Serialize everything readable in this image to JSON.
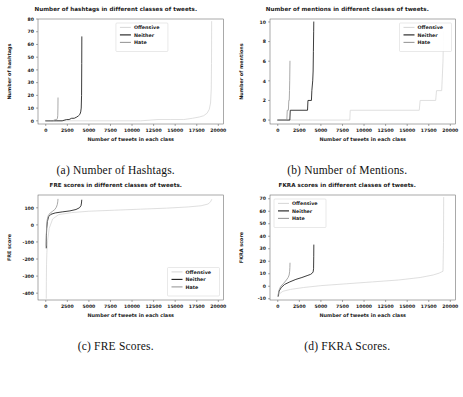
{
  "figure": {
    "layout": "2x2 grid of line charts",
    "series_colors": {
      "Offensive": "#d9d9d9",
      "Neither": "#1a1a1a",
      "Hate": "#9a9a9a"
    }
  },
  "panels": [
    {
      "id": "a",
      "caption": "(a) Number of Hashtags.",
      "legend_position": "top-center",
      "chart_data": {
        "type": "line",
        "title": "Number of hashtags in different classes of tweets.",
        "xlabel": "Number of tweets in each class",
        "ylabel": "Number of hashtags",
        "xlim": [
          -900,
          20600
        ],
        "ylim": [
          -2.5,
          80
        ],
        "xticks": [
          0,
          2500,
          5000,
          7500,
          10000,
          12500,
          15000,
          17500,
          20000
        ],
        "yticks": [
          0,
          10,
          20,
          30,
          40,
          50,
          60,
          70,
          80
        ],
        "grid": false,
        "legend": [
          "Offensive",
          "Neither",
          "Hate"
        ],
        "series": [
          {
            "name": "Offensive",
            "color": "#d9d9d9",
            "x": [
              0,
              2000,
              5000,
              8000,
              11000,
              13000,
              14500,
              16000,
              17000,
              17800,
              18300,
              18700,
              18950,
              19100,
              19180,
              19210,
              19225
            ],
            "y": [
              0,
              0,
              0,
              0,
              0,
              1,
              1,
              1,
              2,
              3,
              4,
              6,
              9,
              14,
              25,
              45,
              78
            ]
          },
          {
            "name": "Neither",
            "color": "#1a1a1a",
            "x": [
              0,
              500,
              1200,
              1900,
              2400,
              2700,
              3000,
              3300,
              3600,
              3800,
              3950,
              4050,
              4110,
              4150,
              4170,
              4180
            ],
            "y": [
              0,
              0,
              0,
              0,
              1,
              1,
              2,
              2,
              3,
              4,
              5,
              7,
              10,
              20,
              45,
              66
            ]
          },
          {
            "name": "Hate",
            "color": "#9a9a9a",
            "x": [
              0,
              400,
              800,
              1100,
              1280,
              1350,
              1390,
              1410,
              1420
            ],
            "y": [
              0,
              0,
              0,
              1,
              1,
              2,
              4,
              10,
              18
            ]
          }
        ]
      }
    },
    {
      "id": "b",
      "caption": "(b) Number of Mentions.",
      "legend_position": "top-right",
      "chart_data": {
        "type": "line",
        "title": "Number of mentions in different classes of tweets.",
        "xlabel": "Number of tweets in each class",
        "ylabel": "Number of mentions",
        "xlim": [
          -900,
          20600
        ],
        "ylim": [
          -0.4,
          10.3
        ],
        "xticks": [
          0,
          2500,
          5000,
          7500,
          10000,
          12500,
          15000,
          17500,
          20000
        ],
        "yticks": [
          0,
          2,
          4,
          6,
          8,
          10
        ],
        "grid": false,
        "legend": [
          "Offensive",
          "Neither",
          "Hate"
        ],
        "series": [
          {
            "name": "Offensive",
            "color": "#d9d9d9",
            "x": [
              0,
              4000,
              8000,
              8350,
              8400,
              16400,
              16500,
              18300,
              18400,
              19000,
              19050,
              19150,
              19200,
              19225
            ],
            "y": [
              0,
              0,
              0,
              0,
              1,
              1,
              2,
              2,
              3,
              3,
              4,
              6,
              8,
              9
            ]
          },
          {
            "name": "Neither",
            "color": "#1a1a1a",
            "x": [
              0,
              1400,
              1450,
              3450,
              3500,
              3900,
              3950,
              4050,
              4100,
              4130,
              4160,
              4175
            ],
            "y": [
              0,
              0,
              1,
              1,
              2,
              2,
              3,
              4,
              5,
              7,
              9,
              10
            ]
          },
          {
            "name": "Hate",
            "color": "#9a9a9a",
            "x": [
              0,
              1050,
              1100,
              1230,
              1280,
              1330,
              1360,
              1385,
              1400,
              1415
            ],
            "y": [
              0,
              0,
              1,
              1,
              2,
              2,
              3,
              4,
              5,
              6
            ]
          }
        ]
      }
    },
    {
      "id": "c",
      "caption": "(c) FRE Scores.",
      "legend_position": "bottom-right",
      "chart_data": {
        "type": "line",
        "title": "FRE scores in different classes of tweets.",
        "xlabel": "Number of tweets in each class",
        "ylabel": "FRE score",
        "xlim": [
          -900,
          20600
        ],
        "ylim": [
          -440,
          175
        ],
        "xticks": [
          0,
          2500,
          5000,
          7500,
          10000,
          12500,
          15000,
          17500,
          20000
        ],
        "yticks": [
          100,
          0,
          -100,
          -200,
          -300,
          -400
        ],
        "grid": false,
        "legend": [
          "Offensive",
          "Neither",
          "Hate"
        ],
        "series": [
          {
            "name": "Offensive",
            "color": "#d9d9d9",
            "x": [
              60,
              70,
              90,
              130,
              220,
              400,
              800,
              1500,
              3000,
              5000,
              8000,
              11000,
              14000,
              16500,
              18000,
              18800,
              19100,
              19220
            ],
            "y": [
              -430,
              -330,
              -230,
              -160,
              -90,
              -20,
              35,
              60,
              72,
              80,
              86,
              92,
              98,
              105,
              112,
              122,
              135,
              148
            ]
          },
          {
            "name": "Neither",
            "color": "#1a1a1a",
            "x": [
              55,
              62,
              75,
              110,
              190,
              330,
              600,
              1100,
              1900,
              2800,
              3500,
              3900,
              4080,
              4140,
              4170
            ],
            "y": [
              -135,
              -100,
              -60,
              -20,
              20,
              48,
              62,
              70,
              76,
              82,
              90,
              100,
              112,
              128,
              145
            ]
          },
          {
            "name": "Hate",
            "color": "#9a9a9a",
            "x": [
              50,
              58,
              70,
              100,
              170,
              300,
              520,
              800,
              1050,
              1220,
              1330,
              1390,
              1415
            ],
            "y": [
              -120,
              -90,
              -55,
              -10,
              30,
              55,
              70,
              80,
              90,
              103,
              118,
              135,
              150
            ]
          }
        ]
      }
    },
    {
      "id": "d",
      "caption": "(d) FKRA Scores.",
      "legend_position": "top-left",
      "chart_data": {
        "type": "line",
        "title": "FKRA scores in different classes of tweets.",
        "xlabel": "Number of tweets in each class",
        "ylabel": "FKRA score",
        "xlim": [
          -900,
          20600
        ],
        "ylim": [
          -11,
          73
        ],
        "xticks": [
          0,
          2500,
          5000,
          7500,
          10000,
          12500,
          15000,
          17500,
          20000
        ],
        "yticks": [
          -10,
          0,
          10,
          20,
          30,
          40,
          50,
          60,
          70
        ],
        "grid": false,
        "legend": [
          "Offensive",
          "Neither",
          "Hate"
        ],
        "series": [
          {
            "name": "Offensive",
            "color": "#d9d9d9",
            "x": [
              50,
              200,
              600,
              1500,
              3000,
              5000,
              8000,
              11000,
              14000,
              16500,
              18000,
              18700,
              19000,
              19150,
              19210,
              19230
            ],
            "y": [
              -8,
              -6,
              -4,
              -2.5,
              -1,
              0.5,
              2,
              3.5,
              5,
              7,
              9,
              10.5,
              11.5,
              12,
              35,
              71
            ]
          },
          {
            "name": "Neither",
            "color": "#1a1a1a",
            "x": [
              45,
              150,
              400,
              800,
              1400,
              2100,
              2800,
              3400,
              3800,
              4000,
              4100,
              4150,
              4170,
              4180
            ],
            "y": [
              -8,
              -4,
              -1,
              1.5,
              3.5,
              5.5,
              7,
              8.5,
              9.5,
              10.5,
              11.5,
              14,
              24,
              33
            ]
          },
          {
            "name": "Hate",
            "color": "#9a9a9a",
            "x": [
              45,
              130,
              350,
              700,
              1000,
              1200,
              1320,
              1380,
              1405,
              1418
            ],
            "y": [
              -7,
              -3.5,
              0,
              2.5,
              5,
              7,
              9,
              12,
              15,
              18.5
            ]
          }
        ]
      }
    }
  ]
}
